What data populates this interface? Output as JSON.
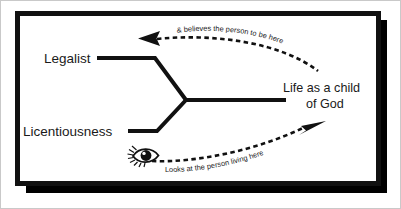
{
  "diagram": {
    "frame": {
      "outline_color": "#c9c9c9",
      "border_color": "#111111",
      "background_color": "#ffffff"
    },
    "nodes": [
      {
        "id": "legalist",
        "label": "Legalist"
      },
      {
        "id": "licentiousness",
        "label": "Licentiousness"
      },
      {
        "id": "life-child-of-god",
        "label_line1": "Life as a child",
        "label_line2": "of God"
      }
    ],
    "annotations": [
      {
        "id": "believes",
        "text": "& believes the person to be here",
        "arrow_direction": "left",
        "style": "dashed-curve"
      },
      {
        "id": "looks",
        "text": "Looks at the person living here",
        "arrow_direction": "right",
        "style": "dashed-curve"
      }
    ],
    "icons": [
      {
        "id": "eye",
        "name": "eye-icon"
      }
    ],
    "colors": {
      "line": "#111111",
      "text": "#1a1a1a",
      "shadow": "#000000"
    }
  }
}
